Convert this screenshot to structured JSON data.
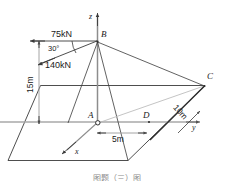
{
  "figure": {
    "type": "engineering-statics-3d-diagram",
    "background_color": "#ffffff",
    "line_color": "#3a3a3a",
    "axis_color": "#9a9a9a",
    "text_color": "#1a1a1a",
    "width": 233,
    "height": 181
  },
  "axes": {
    "z": {
      "label": "z"
    },
    "y": {
      "label": "y"
    },
    "x": {
      "label": "x"
    }
  },
  "points": {
    "A": {
      "label": "A",
      "note": "origin-marker-circle"
    },
    "B": {
      "label": "B"
    },
    "C": {
      "label": "C"
    },
    "D": {
      "label": "D"
    }
  },
  "forces": [
    {
      "label": "75kN",
      "direction": "horizontal-left",
      "applied_at": "B"
    },
    {
      "label": "140kN",
      "direction": "down-left-30-deg",
      "applied_at": "B"
    }
  ],
  "angles": [
    {
      "label": "30°",
      "at": "B",
      "between": "75kN and 140kN"
    }
  ],
  "dimensions": [
    {
      "label": "15m",
      "orientation": "vertical",
      "describes": "height of B above base plane"
    },
    {
      "label": "5m",
      "orientation": "horizontal",
      "describes": "A to D along y"
    },
    {
      "label": "10m",
      "orientation": "diagonal",
      "describes": "edge along x at C"
    }
  ],
  "icons": {
    "origin_marker": "small-circle-icon",
    "arrowhead": "arrowhead-icon"
  },
  "caption": {
    "text": "图题（三）图"
  }
}
